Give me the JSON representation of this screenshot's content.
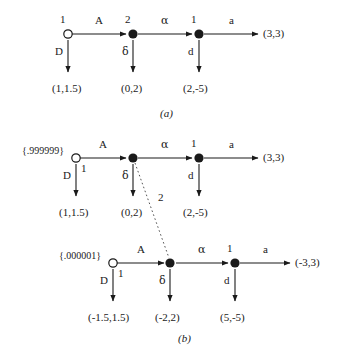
{
  "figure": {
    "background_color": "#ffffff",
    "ink_color": "#1a1a1a",
    "panels": [
      {
        "key": "a",
        "label": "(a)"
      },
      {
        "key": "b",
        "label": "(b)"
      }
    ]
  },
  "panel_a": {
    "label": "(a)",
    "nodes": [
      {
        "id": "a-n1",
        "type": "open",
        "owner": "1"
      },
      {
        "id": "a-n2",
        "type": "filled",
        "owner": "2"
      },
      {
        "id": "a-n3",
        "type": "filled",
        "owner": "1"
      }
    ],
    "owner_labels": {
      "n1": "1",
      "n2": "2",
      "n3": "1"
    },
    "horizontal_actions": {
      "a1": "A",
      "a2": "α",
      "a3": "a"
    },
    "vertical_actions": {
      "d1": "D",
      "d2": "δ",
      "d3": "d"
    },
    "terminal_payoffs": {
      "down1": "(1,1.5)",
      "down2": "(0,2)",
      "down3": "(2,-5)",
      "right": "(3,3)"
    }
  },
  "panel_b": {
    "label": "(b)",
    "infoset_label": "2",
    "top_row": {
      "probability": "{.999999}",
      "nodes": [
        {
          "id": "b-t-n1",
          "type": "open",
          "owner": "1"
        },
        {
          "id": "b-t-n2",
          "type": "filled",
          "owner": "2"
        },
        {
          "id": "b-t-n3",
          "type": "filled",
          "owner": "1"
        }
      ],
      "owner_labels": {
        "n1": "1",
        "n3": "1"
      },
      "horizontal_actions": {
        "a1": "A",
        "a2": "α",
        "a3": "a"
      },
      "vertical_actions": {
        "d1": "D",
        "d2": "δ",
        "d3": "d"
      },
      "terminal_payoffs": {
        "down1": "(1,1.5)",
        "down2": "(0,2)",
        "down3": "(2,-5)",
        "right": "(3,3)"
      }
    },
    "bottom_row": {
      "probability": "{.000001}",
      "nodes": [
        {
          "id": "b-b-n1",
          "type": "open",
          "owner": "1"
        },
        {
          "id": "b-b-n2",
          "type": "filled",
          "owner": "2"
        },
        {
          "id": "b-b-n3",
          "type": "filled",
          "owner": "1"
        }
      ],
      "owner_labels": {
        "n1": "1",
        "n3": "1"
      },
      "horizontal_actions": {
        "a1": "A",
        "a2": "α",
        "a3": "a"
      },
      "vertical_actions": {
        "d1": "D",
        "d2": "δ",
        "d3": "d"
      },
      "terminal_payoffs": {
        "down1": "(-1.5,1.5)",
        "down2": "(-2,2)",
        "down3": "(5,-5)",
        "right": "(-3,3)"
      }
    }
  }
}
